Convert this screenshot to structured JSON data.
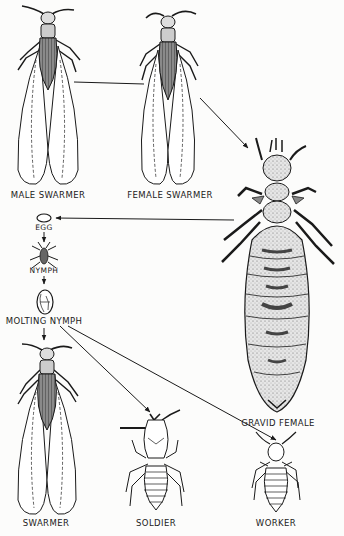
{
  "diagram": {
    "stages": [
      {
        "id": "male_swarmer",
        "label": "MALE SWARMER"
      },
      {
        "id": "female_swarmer",
        "label": "FEMALE SWARMER"
      },
      {
        "id": "gravid_female",
        "label": "GRAVID FEMALE"
      },
      {
        "id": "egg",
        "label": "EGG"
      },
      {
        "id": "nymph",
        "label": "NYMPH"
      },
      {
        "id": "molting_nymph",
        "label": "MOLTING NYMPH"
      },
      {
        "id": "swarmer",
        "label": "SWARMER"
      },
      {
        "id": "soldier",
        "label": "SOLDIER"
      },
      {
        "id": "worker",
        "label": "WORKER"
      }
    ],
    "connections": [
      {
        "from": "male_swarmer",
        "to": "female_swarmer",
        "style": "line"
      },
      {
        "from": "female_swarmer",
        "to": "gravid_female",
        "style": "arrow"
      },
      {
        "from": "gravid_female",
        "to": "egg",
        "style": "arrow"
      },
      {
        "from": "egg",
        "to": "nymph",
        "style": "arrow"
      },
      {
        "from": "nymph",
        "to": "molting_nymph",
        "style": "arrow"
      },
      {
        "from": "molting_nymph",
        "to": "swarmer",
        "style": "arrow"
      },
      {
        "from": "molting_nymph",
        "to": "soldier",
        "style": "arrow"
      },
      {
        "from": "molting_nymph",
        "to": "worker",
        "style": "arrow"
      }
    ]
  },
  "colors": {
    "ink": "#1a1a1a",
    "shade": "#6b6b6b",
    "stipple": "#cfcfcf",
    "paper": "#fcfcfb"
  }
}
